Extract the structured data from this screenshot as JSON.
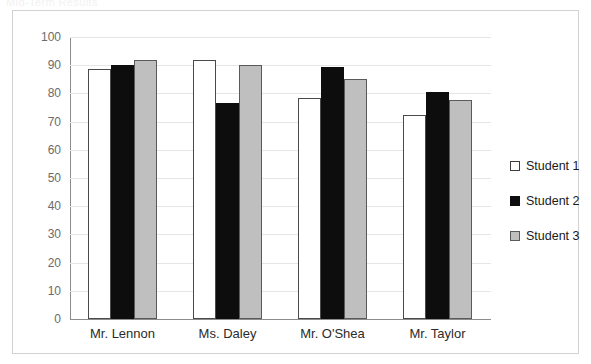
{
  "faint_header_text": "Mid-Term Results",
  "chart_data": {
    "type": "bar",
    "title": "",
    "xlabel": "",
    "ylabel": "",
    "ylim": [
      0,
      100
    ],
    "ytick_step": 10,
    "yticks": [
      100,
      90,
      80,
      70,
      60,
      50,
      40,
      30,
      20,
      10,
      0
    ],
    "grid": true,
    "legend_position": "right",
    "categories": [
      "Mr. Lennon",
      "Ms. Daley",
      "Mr. O'Shea",
      "Mr. Taylor"
    ],
    "series": [
      {
        "name": "Student 1",
        "color": "#ffffff",
        "values": [
          88.5,
          92,
          78.5,
          72.5
        ]
      },
      {
        "name": "Student 2",
        "color": "#0d0d0d",
        "values": [
          90,
          76.5,
          89.5,
          80.5
        ]
      },
      {
        "name": "Student 3",
        "color": "#bfbfbf",
        "values": [
          92,
          90,
          85,
          77.5
        ]
      }
    ]
  }
}
